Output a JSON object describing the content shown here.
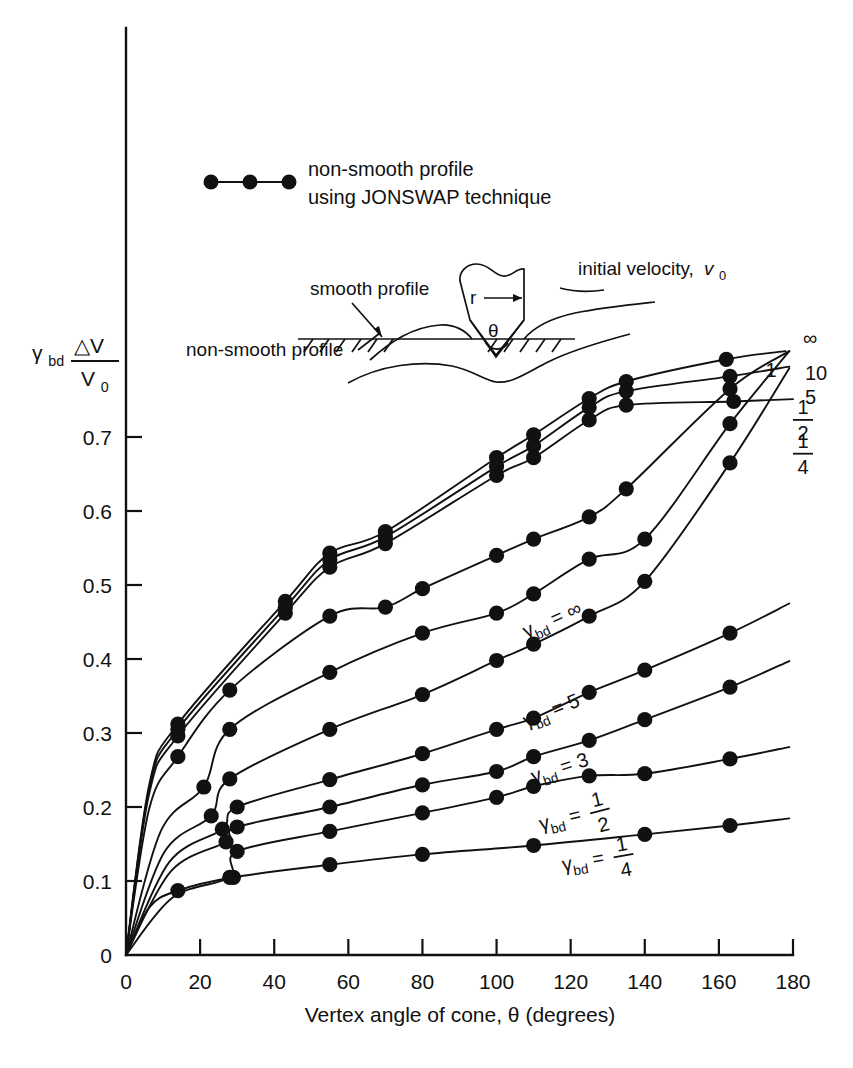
{
  "figure": {
    "background_color": "#ffffff",
    "ink_color": "#111111"
  },
  "legend": {
    "marker_name": "filled-circle-marker",
    "line1": "non-smooth profile",
    "line2": "using JONSWAP technique"
  },
  "inset": {
    "label_smooth": "smooth profile",
    "label_non_smooth": "non-smooth profile",
    "label_initial_velocity": "initial velocity,",
    "symbol_velocity": "v",
    "symbol_velocity_sub": "0",
    "label_radius": "r",
    "label_theta": "θ"
  },
  "axes": {
    "y_label_gamma": "γ",
    "y_label_gamma_sub": "bd",
    "y_label_numerator": "△V",
    "y_label_denominator": "V",
    "y_label_denominator_sub": "0",
    "x_title": "Vertex angle of cone, θ (degrees)",
    "x_ticks": [
      0,
      20,
      40,
      60,
      80,
      100,
      120,
      140,
      160,
      180
    ],
    "y_ticks": [
      0,
      0.1,
      0.2,
      0.3,
      0.4,
      0.5,
      0.6,
      0.7
    ],
    "y_tick_labels": [
      "0",
      "0.1",
      "0.2",
      "0.3",
      "0.4",
      "0.5",
      "0.6",
      "0.7"
    ],
    "x_min": 0,
    "x_max": 180,
    "y_min": 0,
    "y_max": 0.82
  },
  "curve_end_labels": [
    {
      "name": "end-label-infinity",
      "text": "∞",
      "x": 180,
      "y": 0.805
    },
    {
      "name": "end-label-10",
      "text": "10",
      "x": 180,
      "y": 0.775
    },
    {
      "name": "end-label-5",
      "text": "5",
      "x": 180,
      "y": 0.742
    },
    {
      "name": "end-label-1",
      "text": "1",
      "x": 172,
      "y": 0.76
    },
    {
      "name": "end-label-one-half",
      "text": "1/2",
      "x": 180,
      "y": 0.715
    },
    {
      "name": "end-label-one-quarter",
      "text": "1/4",
      "x": 180,
      "y": 0.672
    }
  ],
  "inline_curve_labels": [
    {
      "name": "curve-label-gamma-infinity",
      "prefix": "γ",
      "sub": "bd",
      "eq": " = ",
      "value": "∞",
      "x": 108,
      "y": 0.428,
      "rot": -24
    },
    {
      "name": "curve-label-gamma-5",
      "prefix": "γ",
      "sub": "bd",
      "eq": " = ",
      "value": "5",
      "x": 108,
      "y": 0.307,
      "rot": -22
    },
    {
      "name": "curve-label-gamma-3",
      "prefix": "γ",
      "sub": "bd",
      "eq": " = ",
      "value": "3",
      "x": 110,
      "y": 0.232,
      "rot": -18
    },
    {
      "name": "curve-label-gamma-one-half",
      "prefix": "γ",
      "sub": "bd",
      "eq": " = ",
      "value": "1/2",
      "x": 112,
      "y": 0.168,
      "rot": -14
    },
    {
      "name": "curve-label-gamma-one-quarter",
      "prefix": "γ",
      "sub": "bd",
      "eq": " = ",
      "value": "1/4",
      "x": 118,
      "y": 0.113,
      "rot": -10
    }
  ],
  "chart_data": {
    "type": "line",
    "title": "",
    "xlabel": "Vertex angle of cone, θ (degrees)",
    "ylabel": "γ_bd ΔV/V_0",
    "xlim": [
      0,
      180
    ],
    "ylim": [
      0,
      0.82
    ],
    "xticks": [
      0,
      20,
      40,
      60,
      80,
      100,
      120,
      140,
      160,
      180
    ],
    "yticks": [
      0,
      0.1,
      0.2,
      0.3,
      0.4,
      0.5,
      0.6,
      0.7
    ],
    "grid": false,
    "legend_position": "upper-left",
    "legend_entries": [
      "non-smooth profile using JONSWAP technique"
    ],
    "series": [
      {
        "name": "gamma_bd = infinity",
        "label": "∞",
        "points": [
          [
            14,
            0.312
          ],
          [
            43,
            0.478
          ],
          [
            55,
            0.543
          ],
          [
            70,
            0.572
          ],
          [
            100,
            0.672
          ],
          [
            110,
            0.703
          ],
          [
            125,
            0.752
          ],
          [
            135,
            0.775
          ],
          [
            162,
            0.805
          ]
        ]
      },
      {
        "name": "gamma_bd = 10",
        "label": "10",
        "points": [
          [
            14,
            0.305
          ],
          [
            43,
            0.47
          ],
          [
            55,
            0.534
          ],
          [
            70,
            0.565
          ],
          [
            100,
            0.66
          ],
          [
            110,
            0.688
          ],
          [
            125,
            0.74
          ],
          [
            135,
            0.762
          ],
          [
            163,
            0.782
          ]
        ]
      },
      {
        "name": "gamma_bd = 5",
        "label": "5",
        "points": [
          [
            14,
            0.296
          ],
          [
            43,
            0.462
          ],
          [
            55,
            0.524
          ],
          [
            70,
            0.556
          ],
          [
            100,
            0.648
          ],
          [
            110,
            0.672
          ],
          [
            125,
            0.723
          ],
          [
            135,
            0.743
          ],
          [
            164,
            0.748
          ]
        ]
      },
      {
        "name": "gamma_bd = 3",
        "label": "1",
        "points": [
          [
            14,
            0.268
          ],
          [
            28,
            0.358
          ],
          [
            55,
            0.458
          ],
          [
            70,
            0.47
          ],
          [
            80,
            0.495
          ],
          [
            100,
            0.54
          ],
          [
            110,
            0.562
          ],
          [
            125,
            0.592
          ],
          [
            135,
            0.63
          ],
          [
            163,
            0.765
          ]
        ]
      },
      {
        "name": "gamma_bd = 1",
        "label": "1/2",
        "points": [
          [
            21,
            0.227
          ],
          [
            28,
            0.305
          ],
          [
            55,
            0.382
          ],
          [
            80,
            0.435
          ],
          [
            100,
            0.462
          ],
          [
            110,
            0.488
          ],
          [
            125,
            0.535
          ],
          [
            140,
            0.562
          ],
          [
            163,
            0.718
          ]
        ]
      },
      {
        "name": "gamma_bd = 1/2 upper",
        "label": "1/4",
        "points": [
          [
            23,
            0.188
          ],
          [
            28,
            0.238
          ],
          [
            55,
            0.305
          ],
          [
            80,
            0.352
          ],
          [
            100,
            0.398
          ],
          [
            110,
            0.42
          ],
          [
            125,
            0.458
          ],
          [
            140,
            0.505
          ],
          [
            163,
            0.665
          ]
        ]
      },
      {
        "name": "gamma_bd = 1/2",
        "label": "γbd = 1/2",
        "points": [
          [
            26,
            0.17
          ],
          [
            30,
            0.2
          ],
          [
            55,
            0.237
          ],
          [
            80,
            0.272
          ],
          [
            100,
            0.305
          ],
          [
            110,
            0.32
          ],
          [
            125,
            0.355
          ],
          [
            140,
            0.385
          ],
          [
            163,
            0.435
          ]
        ]
      },
      {
        "name": "gamma_bd = 1/4 mid",
        "label": "",
        "points": [
          [
            27,
            0.153
          ],
          [
            30,
            0.173
          ],
          [
            55,
            0.2
          ],
          [
            80,
            0.23
          ],
          [
            100,
            0.248
          ],
          [
            110,
            0.268
          ],
          [
            125,
            0.29
          ],
          [
            140,
            0.318
          ],
          [
            163,
            0.362
          ]
        ]
      },
      {
        "name": "gamma_bd = 1/4 low",
        "label": "",
        "points": [
          [
            28,
            0.105
          ],
          [
            30,
            0.14
          ],
          [
            55,
            0.167
          ],
          [
            80,
            0.192
          ],
          [
            100,
            0.213
          ],
          [
            110,
            0.228
          ],
          [
            125,
            0.242
          ],
          [
            140,
            0.245
          ],
          [
            163,
            0.265
          ]
        ]
      },
      {
        "name": "gamma_bd = 1/4",
        "label": "γbd = 1/4",
        "points": [
          [
            14,
            0.087
          ],
          [
            29,
            0.105
          ],
          [
            55,
            0.122
          ],
          [
            80,
            0.136
          ],
          [
            110,
            0.148
          ],
          [
            140,
            0.163
          ],
          [
            163,
            0.175
          ]
        ]
      }
    ]
  }
}
